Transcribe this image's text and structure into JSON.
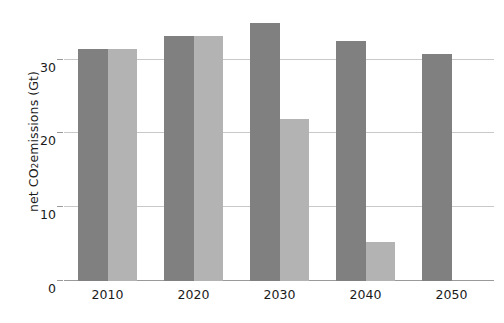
{
  "chart_data": {
    "type": "bar",
    "title": "",
    "subtitle": "",
    "xlabel": "",
    "ylabel": "net CO2 emissions (Gt)",
    "ylabel_parts": {
      "pre": "net CO",
      "sub": "2",
      "post": " emissions (Gt)"
    },
    "categories": [
      "2010",
      "2020",
      "2030",
      "2040",
      "2050"
    ],
    "series": [
      {
        "name": "dark-series",
        "color": "#808080",
        "values": [
          31.5,
          33.2,
          35.0,
          32.5,
          30.8
        ]
      },
      {
        "name": "light-series",
        "color": "#b3b3b3",
        "values": [
          31.5,
          33.2,
          22.0,
          5.3,
          null
        ]
      }
    ],
    "ylim": [
      0,
      37
    ],
    "yticks": [
      0,
      10,
      20,
      30
    ],
    "ytick_labels": [
      "0",
      "10",
      "20",
      "30"
    ],
    "grid": true,
    "grid_color": "#c9c9c9",
    "legend": false,
    "legend_position": "none",
    "background_color": "#ffffff",
    "axis_color": "#9a9a9a"
  }
}
